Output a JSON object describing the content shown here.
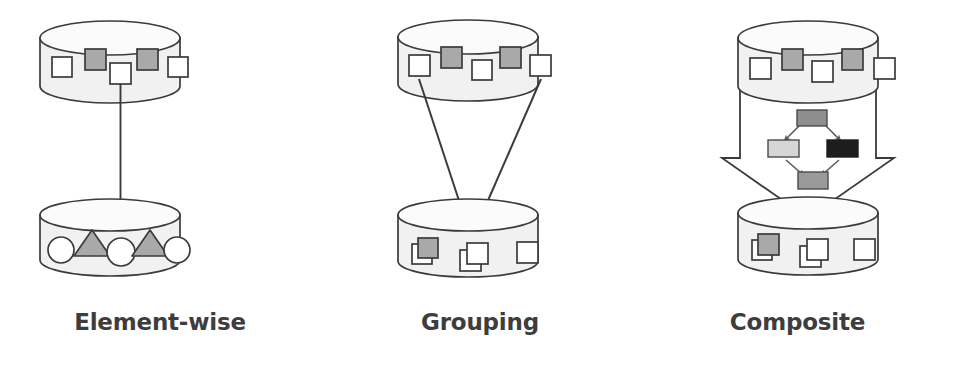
{
  "figure": {
    "background": "#ffffff",
    "width": 955,
    "height": 373
  },
  "palette": {
    "outline": "#3b3b3b",
    "cylinder_body": "#f1f1f1",
    "cylinder_top": "#fbfbfb",
    "shape_white": "#ffffff",
    "shape_gray": "#a9a9a9",
    "shape_light_gray": "#d6d6d6",
    "shape_mid_gray": "#8e8e8e",
    "shape_dark": "#1d1d1d",
    "arrow_fill": "#ffffff",
    "arrow_solid": "#3b3b3b",
    "label_text": "#3d3d3d"
  },
  "panels": [
    {
      "id": "element-wise",
      "label": "Element-wise",
      "source_store": {
        "name": "source-collection",
        "shapes": [
          {
            "kind": "square",
            "fill": "white"
          },
          {
            "kind": "square",
            "fill": "gray"
          },
          {
            "kind": "square",
            "fill": "white",
            "highlighted": true
          },
          {
            "kind": "square",
            "fill": "gray"
          },
          {
            "kind": "square",
            "fill": "white"
          }
        ]
      },
      "target_store": {
        "name": "target-collection",
        "shapes": [
          {
            "kind": "circle",
            "fill": "white"
          },
          {
            "kind": "triangle",
            "fill": "gray"
          },
          {
            "kind": "circle",
            "fill": "white",
            "highlighted": true
          },
          {
            "kind": "triangle",
            "fill": "gray"
          },
          {
            "kind": "circle",
            "fill": "white"
          }
        ]
      },
      "mapping": {
        "type": "one-to-one",
        "arrows": 1,
        "description": "single element maps to single element"
      }
    },
    {
      "id": "grouping",
      "label": "Grouping",
      "source_store": {
        "name": "source-collection",
        "shapes": [
          {
            "kind": "square",
            "fill": "white",
            "highlighted": true
          },
          {
            "kind": "square",
            "fill": "gray"
          },
          {
            "kind": "square",
            "fill": "white"
          },
          {
            "kind": "square",
            "fill": "gray"
          },
          {
            "kind": "square",
            "fill": "white",
            "highlighted": true
          }
        ]
      },
      "target_store": {
        "name": "target-collection",
        "shapes": [
          {
            "kind": "stacked-square",
            "fill": "gray"
          },
          {
            "kind": "stacked-square",
            "fill": "white",
            "highlighted": true
          },
          {
            "kind": "square",
            "fill": "white"
          }
        ]
      },
      "mapping": {
        "type": "many-to-one",
        "arrows": 2,
        "description": "two elements merge into one grouped element"
      }
    },
    {
      "id": "composite",
      "label": "Composite",
      "source_store": {
        "name": "source-collection",
        "shapes": [
          {
            "kind": "square",
            "fill": "white"
          },
          {
            "kind": "square",
            "fill": "gray"
          },
          {
            "kind": "square",
            "fill": "white"
          },
          {
            "kind": "square",
            "fill": "gray"
          },
          {
            "kind": "square",
            "fill": "white"
          }
        ]
      },
      "target_store": {
        "name": "target-collection",
        "shapes": [
          {
            "kind": "stacked-square",
            "fill": "gray"
          },
          {
            "kind": "stacked-square",
            "fill": "white"
          },
          {
            "kind": "square",
            "fill": "white"
          }
        ]
      },
      "mapping": {
        "type": "block-arrow",
        "description": "broad transformation arrow containing a workflow graph"
      },
      "inner_workflow": {
        "name": "composite-workflow-graph",
        "nodes": [
          {
            "id": "n1",
            "position": "top",
            "fill": "mid_gray"
          },
          {
            "id": "n2",
            "position": "left",
            "fill": "light_gray"
          },
          {
            "id": "n3",
            "position": "right",
            "fill": "dark"
          },
          {
            "id": "n4",
            "position": "bottom",
            "fill": "mid_gray"
          }
        ],
        "edges": [
          {
            "from": "n1",
            "to": "n2"
          },
          {
            "from": "n1",
            "to": "n3"
          },
          {
            "from": "n2",
            "to": "n4"
          },
          {
            "from": "n3",
            "to": "n4"
          }
        ]
      }
    }
  ]
}
